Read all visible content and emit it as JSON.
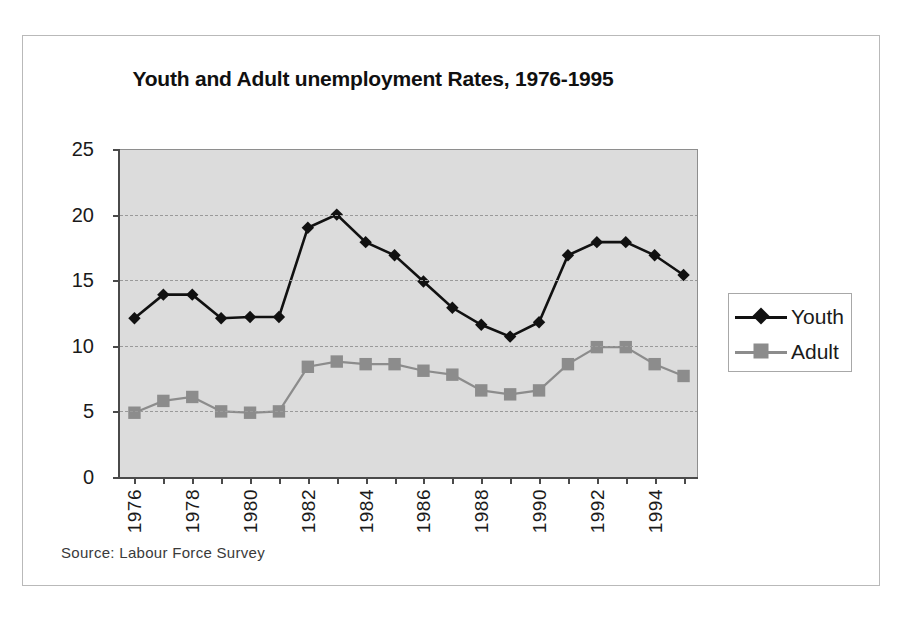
{
  "figure": {
    "title": "Youth and Adult unemployment Rates, 1976-1995",
    "source_note": "Source:  Labour Force Survey",
    "plot_background": "#dcdcdc",
    "frame_color": "#b9b9b9"
  },
  "legend": {
    "position": "right",
    "entries": [
      {
        "label": "Youth",
        "color": "#111111",
        "marker": "diamond"
      },
      {
        "label": "Adult",
        "color": "#8c8c8c",
        "marker": "square"
      }
    ]
  },
  "axes": {
    "y_ticks": [
      "0",
      "5",
      "10",
      "15",
      "20",
      "25"
    ],
    "x_tick_labels": [
      "1976",
      "1978",
      "1980",
      "1982",
      "1984",
      "1986",
      "1988",
      "1990",
      "1992",
      "1994"
    ]
  },
  "chart_data": {
    "type": "line",
    "title": "Youth and Adult unemployment Rates, 1976-1995",
    "xlabel": "",
    "ylabel": "",
    "ylim": [
      0,
      25
    ],
    "yticks": [
      0,
      5,
      10,
      15,
      20,
      25
    ],
    "grid": true,
    "legend_position": "right",
    "annotations": [
      "Source:  Labour Force Survey"
    ],
    "x": [
      1976,
      1977,
      1978,
      1979,
      1980,
      1981,
      1982,
      1983,
      1984,
      1985,
      1986,
      1987,
      1988,
      1989,
      1990,
      1991,
      1992,
      1993,
      1994,
      1995
    ],
    "x_labeled_ticks": [
      1976,
      1978,
      1980,
      1982,
      1984,
      1986,
      1988,
      1990,
      1992,
      1994
    ],
    "series": [
      {
        "name": "Youth",
        "color": "#111111",
        "marker": "diamond",
        "values": [
          12.1,
          13.9,
          13.9,
          12.1,
          12.2,
          12.2,
          19.0,
          20.0,
          17.9,
          16.9,
          14.9,
          12.9,
          11.6,
          10.7,
          11.8,
          16.9,
          17.9,
          17.9,
          16.9,
          15.4
        ]
      },
      {
        "name": "Adult",
        "color": "#8c8c8c",
        "marker": "square",
        "values": [
          4.9,
          5.8,
          6.1,
          5.0,
          4.9,
          5.0,
          8.4,
          8.8,
          8.6,
          8.6,
          8.1,
          7.8,
          6.6,
          6.3,
          6.6,
          8.6,
          9.9,
          9.9,
          8.6,
          7.7
        ]
      }
    ]
  }
}
